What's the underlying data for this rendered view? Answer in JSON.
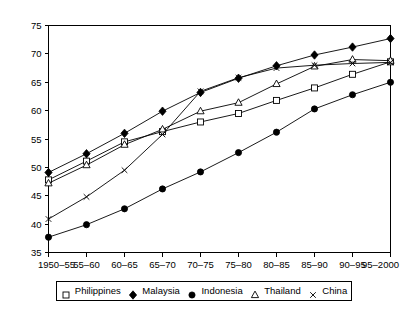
{
  "chart_data": {
    "type": "line",
    "title": "",
    "subtitle": "",
    "xlabel": "",
    "ylabel": "",
    "ylim": [
      35,
      75
    ],
    "ytick_labels": [
      "35",
      "40",
      "45",
      "50",
      "55",
      "60",
      "65",
      "70",
      "75"
    ],
    "ytick_values": [
      35,
      40,
      45,
      50,
      55,
      60,
      65,
      70,
      75
    ],
    "grid": false,
    "legend_position": "bottom",
    "categories": [
      "1950–55",
      "55–60",
      "60–65",
      "65–70",
      "70–75",
      "75–80",
      "80–85",
      "85–90",
      "90–95",
      "95–2000"
    ],
    "series": [
      {
        "name": "Philippines",
        "marker": "open-square",
        "values": [
          47.8,
          51.1,
          54.5,
          56.3,
          58.0,
          59.5,
          61.8,
          64.0,
          66.4,
          68.6
        ]
      },
      {
        "name": "Malaysia",
        "marker": "filled-diamond",
        "values": [
          49.1,
          52.4,
          56.0,
          59.9,
          63.2,
          65.7,
          67.9,
          69.8,
          71.2,
          72.7
        ]
      },
      {
        "name": "Indonesia",
        "marker": "filled-circle",
        "values": [
          37.7,
          39.9,
          42.7,
          46.2,
          49.2,
          52.6,
          56.2,
          60.3,
          62.8,
          65.0
        ]
      },
      {
        "name": "Thailand",
        "marker": "open-triangle",
        "values": [
          47.2,
          50.4,
          54.0,
          56.7,
          59.9,
          61.4,
          64.7,
          67.8,
          69.0,
          68.8
        ]
      },
      {
        "name": "China",
        "marker": "cross",
        "values": [
          40.9,
          44.8,
          49.5,
          55.8,
          63.4,
          65.8,
          67.5,
          68.0,
          68.3,
          68.5
        ]
      }
    ]
  },
  "legend": {
    "entries": [
      {
        "label": "Philippines",
        "marker": "open-square"
      },
      {
        "label": "Malaysia",
        "marker": "filled-diamond"
      },
      {
        "label": "Indonesia",
        "marker": "filled-circle"
      },
      {
        "label": "Thailand",
        "marker": "open-triangle"
      },
      {
        "label": "China",
        "marker": "cross"
      }
    ]
  }
}
